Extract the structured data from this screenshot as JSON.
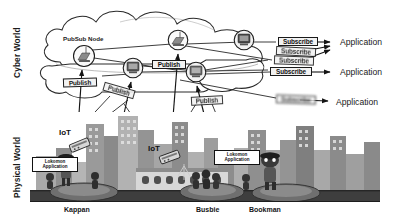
{
  "figure": {
    "axis_labels": {
      "cyber_world": "Cyber World",
      "physical_world": "Physical World"
    },
    "colors": {
      "line": "#1a1a1a",
      "cloud_fill": "#ffffff",
      "box_fill": "#f2f2f2",
      "ground": "#3c3c3c",
      "building_dark": "#6e6e6e",
      "building_mid": "#8e8e8e",
      "building_light": "#b4b4b4"
    }
  },
  "cloud": {
    "caption": "PubSub Node",
    "nodes": [
      {
        "id": "node-1",
        "icon": "server-node-icon",
        "cx": 84,
        "cy": 56,
        "r": 11
      },
      {
        "id": "node-2",
        "icon": "server-node-icon",
        "cx": 178,
        "cy": 40,
        "r": 10
      },
      {
        "id": "node-3",
        "icon": "server-node-icon",
        "cx": 244,
        "cy": 40,
        "r": 10
      },
      {
        "id": "node-4",
        "icon": "server-node-icon",
        "cx": 133,
        "cy": 68,
        "r": 10
      },
      {
        "id": "node-5",
        "icon": "server-node-icon",
        "cx": 196,
        "cy": 72,
        "r": 10
      }
    ]
  },
  "publish_messages": [
    {
      "label": "Publish",
      "x": 63,
      "y": 78,
      "w": 34,
      "rot": -2,
      "blur": "none"
    },
    {
      "label": "Publish",
      "x": 103,
      "y": 86,
      "w": 32,
      "rot": 16,
      "blur": "soft"
    },
    {
      "label": "Publish",
      "x": 152,
      "y": 60,
      "w": 34,
      "rot": 0,
      "blur": "none"
    },
    {
      "label": "Publish",
      "x": 191,
      "y": 96,
      "w": 32,
      "rot": -3,
      "blur": "soft"
    }
  ],
  "subscribe_messages": [
    {
      "label": "Subscribe",
      "x": 278,
      "y": 37,
      "w": 40,
      "rot": 0,
      "blur": "none"
    },
    {
      "label": "Subscribe",
      "x": 276,
      "y": 47,
      "w": 40,
      "rot": 3,
      "blur": "soft"
    },
    {
      "label": "Subscribe",
      "x": 274,
      "y": 56,
      "w": 40,
      "rot": 2,
      "blur": "soft"
    },
    {
      "label": "Subscribe",
      "x": 270,
      "y": 67,
      "w": 42,
      "rot": 0,
      "blur": "none"
    },
    {
      "label": "Subscribe",
      "x": 276,
      "y": 95,
      "w": 40,
      "rot": 2,
      "blur": "heavy"
    }
  ],
  "applications": [
    {
      "label": "Application",
      "x": 340,
      "y": 37
    },
    {
      "label": "Application",
      "x": 340,
      "y": 67
    },
    {
      "label": "Application",
      "x": 336,
      "y": 97
    }
  ],
  "physical_world": {
    "iot_labels": [
      {
        "label": "IoT",
        "x": 59,
        "y": 128
      },
      {
        "label": "IoT",
        "x": 148,
        "y": 144
      }
    ],
    "app_boxes": [
      {
        "line1": "Lokomon",
        "line2": "Application",
        "x": 32,
        "y": 157,
        "w": 46
      },
      {
        "line1": "Lokomon",
        "line2": "Application",
        "x": 214,
        "y": 150,
        "w": 46
      }
    ],
    "cities": [
      {
        "label": "Kappan",
        "x": 64,
        "y": 209
      },
      {
        "label": "Busbie",
        "x": 196,
        "y": 209
      },
      {
        "label": "Bookman",
        "x": 249,
        "y": 209
      }
    ]
  }
}
